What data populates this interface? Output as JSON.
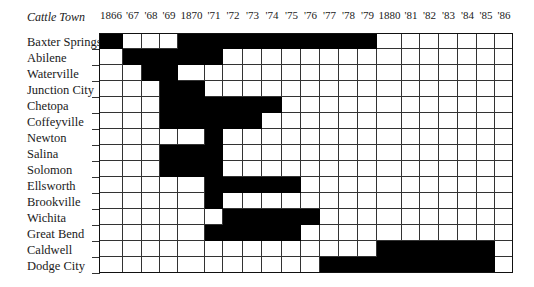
{
  "header": {
    "corner_title": "Cattle Town",
    "years": [
      "1866",
      "'67",
      "'68",
      "'69",
      "1870",
      "'71",
      "'72",
      "'73",
      "'74",
      "'75",
      "'76",
      "'77",
      "'78",
      "'79",
      "1880",
      "'81",
      "'82",
      "'83",
      "'84",
      "'85",
      "'86"
    ]
  },
  "towns": [
    "Baxter Springs",
    "Abilene",
    "Waterville",
    "Junction City",
    "Chetopa",
    "Coffeyville",
    "Newton",
    "Salina",
    "Solomon",
    "Ellsworth",
    "Brookville",
    "Wichita",
    "Great Bend",
    "Caldwell",
    "Dodge City"
  ],
  "colors": {
    "active": "#000000",
    "inactive": "#ffffff",
    "grid": "#333333"
  },
  "chart_data": {
    "type": "heatmap",
    "title": "Cattle Town",
    "xlabel": "Year",
    "ylabel": "Cattle Town",
    "categories": [
      "1866",
      "1867",
      "1868",
      "1869",
      "1870",
      "1871",
      "1872",
      "1873",
      "1874",
      "1875",
      "1876",
      "1877",
      "1878",
      "1879",
      "1880",
      "1881",
      "1882",
      "1883",
      "1884",
      "1885",
      "1886"
    ],
    "series": [
      {
        "name": "Baxter Springs",
        "active_years": [
          1866,
          1870,
          1871,
          1872,
          1873,
          1874,
          1875,
          1876,
          1877,
          1878,
          1879
        ]
      },
      {
        "name": "Abilene",
        "active_years": [
          1867,
          1868,
          1869,
          1870,
          1871
        ]
      },
      {
        "name": "Waterville",
        "active_years": [
          1868,
          1869
        ]
      },
      {
        "name": "Junction City",
        "active_years": [
          1869,
          1870
        ]
      },
      {
        "name": "Chetopa",
        "active_years": [
          1869,
          1870,
          1871,
          1872,
          1873,
          1874
        ]
      },
      {
        "name": "Coffeyville",
        "active_years": [
          1869,
          1870,
          1871,
          1872,
          1873
        ]
      },
      {
        "name": "Newton",
        "active_years": [
          1871
        ]
      },
      {
        "name": "Salina",
        "active_years": [
          1869,
          1870,
          1871
        ]
      },
      {
        "name": "Solomon",
        "active_years": [
          1869,
          1870,
          1871
        ]
      },
      {
        "name": "Ellsworth",
        "active_years": [
          1871,
          1872,
          1873,
          1874,
          1875
        ]
      },
      {
        "name": "Brookville",
        "active_years": [
          1871
        ]
      },
      {
        "name": "Wichita",
        "active_years": [
          1872,
          1873,
          1874,
          1875,
          1876
        ]
      },
      {
        "name": "Great Bend",
        "active_years": [
          1871,
          1872,
          1873,
          1874,
          1875
        ]
      },
      {
        "name": "Caldwell",
        "active_years": [
          1880,
          1881,
          1882,
          1883,
          1884,
          1885
        ]
      },
      {
        "name": "Dodge City",
        "active_years": [
          1877,
          1878,
          1879,
          1880,
          1881,
          1882,
          1883,
          1884,
          1885
        ]
      }
    ],
    "legend": "black cell = active cattle town in that year",
    "grid": true
  }
}
